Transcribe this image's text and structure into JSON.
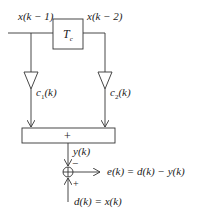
{
  "diagram": {
    "type": "adaptive linear predictor block diagram",
    "labels": {
      "x_k1": "x(k − 1)",
      "x_k2": "x(k − 2)",
      "delay": "T",
      "delay_sub": "c",
      "c1": "c",
      "c1_sub": "1",
      "c1_arg": "(k)",
      "c2": "c",
      "c2_sub": "2",
      "c2_arg": "(k)",
      "sum": "+",
      "y": "y(k)",
      "minus": "−",
      "plus": "+",
      "error": "e(k) = d(k) − y(k)",
      "desired": "d(k) = x(k)"
    },
    "colors": {
      "line": "#333333",
      "background": "#ffffff"
    }
  }
}
